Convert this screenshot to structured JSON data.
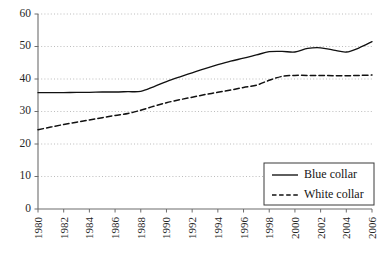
{
  "chart_data": {
    "type": "line",
    "title": "",
    "subtitle": "",
    "xlabel": "",
    "ylabel": "",
    "xlim": [
      1980,
      2006
    ],
    "ylim": [
      0,
      60
    ],
    "y_ticks": [
      0,
      10,
      20,
      30,
      40,
      50,
      60
    ],
    "grid": true,
    "grid_style": "dotted-horizontal",
    "legend_position": "bottom-right",
    "categories": [
      1980,
      1981,
      1982,
      1983,
      1984,
      1985,
      1986,
      1987,
      1988,
      1989,
      1990,
      1991,
      1992,
      1993,
      1994,
      1995,
      1996,
      1997,
      1998,
      1999,
      2000,
      2001,
      2002,
      2003,
      2004,
      2005,
      2006
    ],
    "x_tick_labels": [
      "1980",
      "1982",
      "1984",
      "1986",
      "1988",
      "1990",
      "1992",
      "1994",
      "1996",
      "1998",
      "2000",
      "2002",
      "2004",
      "2006"
    ],
    "x_tick_values": [
      1980,
      1982,
      1984,
      1986,
      1988,
      1990,
      1992,
      1994,
      1996,
      1998,
      2000,
      2002,
      2004,
      2006
    ],
    "series": [
      {
        "name": "Blue collar",
        "style": "solid",
        "color": "#111111",
        "values": [
          35.8,
          35.8,
          35.8,
          35.9,
          35.9,
          36.0,
          36.0,
          36.1,
          36.2,
          37.6,
          39.2,
          40.6,
          41.9,
          43.2,
          44.4,
          45.5,
          46.4,
          47.4,
          48.4,
          48.5,
          48.3,
          49.4,
          49.6,
          48.9,
          48.3,
          49.6,
          51.5
        ]
      },
      {
        "name": "White collar",
        "style": "dashed",
        "color": "#111111",
        "values": [
          24.4,
          25.2,
          26.0,
          26.7,
          27.4,
          28.1,
          28.8,
          29.4,
          30.4,
          31.6,
          32.7,
          33.6,
          34.4,
          35.2,
          35.9,
          36.6,
          37.4,
          38.1,
          39.6,
          40.8,
          41.1,
          41.1,
          41.1,
          41.0,
          41.0,
          41.1,
          41.2
        ]
      }
    ],
    "legend": [
      {
        "label": "Blue collar",
        "style": "solid"
      },
      {
        "label": "White collar",
        "style": "dashed"
      }
    ]
  },
  "colors": {
    "axis": "#6d6d6d",
    "grid": "#b4b4b4",
    "line": "#111111",
    "text": "#1a1a1a",
    "background": "#ffffff"
  }
}
